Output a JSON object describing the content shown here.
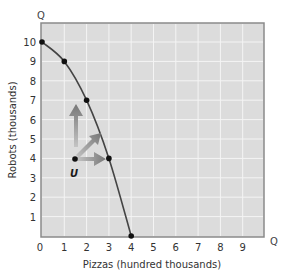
{
  "chart_data": {
    "type": "line",
    "title": "",
    "xlabel": "Pizzas (hundred thousands)",
    "ylabel": "Robots (thousands)",
    "x_axis_end_label": "Q",
    "y_axis_end_label": "Q",
    "xlim": [
      0,
      10
    ],
    "ylim": [
      0,
      11
    ],
    "x_ticks": [
      "0",
      "1",
      "2",
      "3",
      "4",
      "5",
      "6",
      "7",
      "8",
      "9"
    ],
    "y_ticks": [
      "1",
      "2",
      "3",
      "4",
      "5",
      "6",
      "7",
      "8",
      "9",
      "10"
    ],
    "grid": true,
    "series": [
      {
        "name": "Production possibilities frontier",
        "points": [
          {
            "x": 0,
            "y": 10
          },
          {
            "x": 1,
            "y": 9
          },
          {
            "x": 2,
            "y": 7
          },
          {
            "x": 3,
            "y": 4
          },
          {
            "x": 4,
            "y": 0
          }
        ]
      }
    ],
    "annotations": [
      {
        "label": "U",
        "x": 1.5,
        "y": 4,
        "type": "point",
        "note": "inefficient point inside frontier"
      },
      {
        "type": "arrow",
        "from": [
          1.5,
          4
        ],
        "direction": "up",
        "to": [
          1.5,
          7
        ]
      },
      {
        "type": "arrow",
        "from": [
          1.5,
          4
        ],
        "direction": "up-right"
      },
      {
        "type": "arrow",
        "from": [
          1.5,
          4
        ],
        "direction": "right",
        "to": [
          3,
          4
        ]
      }
    ]
  },
  "labels": {
    "x_axis": "Pizzas (hundred thousands)",
    "y_axis": "Robots (thousands)",
    "x_end": "Q",
    "y_end": "Q",
    "point_u": "U",
    "x_ticks": [
      "0",
      "1",
      "2",
      "3",
      "4",
      "5",
      "6",
      "7",
      "8",
      "9"
    ],
    "y_ticks": [
      "1",
      "2",
      "3",
      "4",
      "5",
      "6",
      "7",
      "8",
      "9",
      "10"
    ]
  },
  "colors": {
    "plot_bg": "#dcdcdc",
    "grid": "#f2f2f2",
    "frame": "#8a8a8a",
    "curve": "#444444",
    "point": "#111111",
    "arrow": "#8a8a8a"
  }
}
